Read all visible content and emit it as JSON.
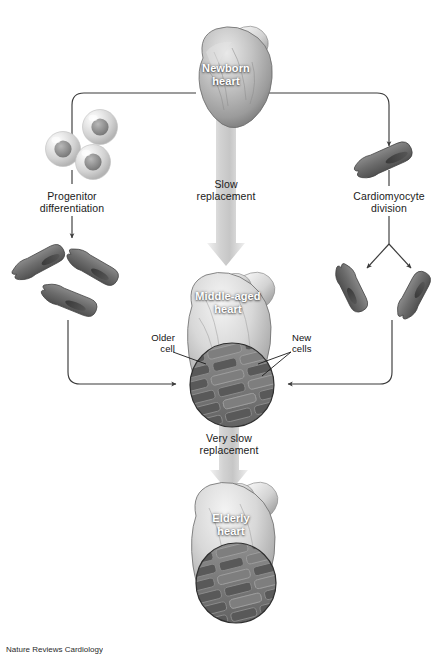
{
  "figure": {
    "background_color": "#ffffff",
    "line_color": "#3b3b3b",
    "cell_color": "#6e6e6e",
    "arrow_fill": "#cfcfcf"
  },
  "nodes": {
    "newborn_heart": {
      "label_line1": "Newborn",
      "label_line2": "heart"
    },
    "middle_aged_heart": {
      "label_line1": "Middle-aged",
      "label_line2": "heart"
    },
    "elderly_heart": {
      "label_line1": "Elderly",
      "label_line2": "heart"
    }
  },
  "pathways": {
    "progenitor": {
      "line1": "Progenitor",
      "line2": "differentiation"
    },
    "slow": {
      "line1": "Slow",
      "line2": "replacement"
    },
    "cardiomyocyte": {
      "line1": "Cardiomyocyte",
      "line2": "division"
    },
    "very_slow": {
      "line1": "Very slow",
      "line2": "replacement"
    }
  },
  "annotations": {
    "older_cell": {
      "line1": "Older",
      "line2": "cell"
    },
    "new_cells": {
      "line1": "New",
      "line2": "cells"
    }
  },
  "caption": {
    "text": "Nature Reviews Cardiology"
  }
}
